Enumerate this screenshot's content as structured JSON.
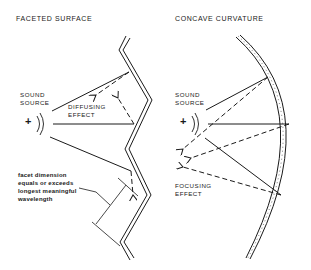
{
  "left_panel": {
    "title": "FACETED SURFACE",
    "source_label_line1": "SOUND",
    "source_label_line2": "SOURCE",
    "source_symbol": "+",
    "effect_label_line1": "DIFFUSING",
    "effect_label_line2": "EFFECT",
    "annotation_line1": "facet dimension",
    "annotation_line2": "equals or exceeds",
    "annotation_line3": "longest meaningful",
    "annotation_line4": "wavelength"
  },
  "right_panel": {
    "title": "CONCAVE CURVATURE",
    "source_label_line1": "SOUND",
    "source_label_line2": "SOURCE",
    "source_symbol": "+",
    "effect_label_line1": "FOCUSING",
    "effect_label_line2": "EFFECT"
  },
  "colors": {
    "ink": "#1a1a1a",
    "background": "#ffffff"
  }
}
